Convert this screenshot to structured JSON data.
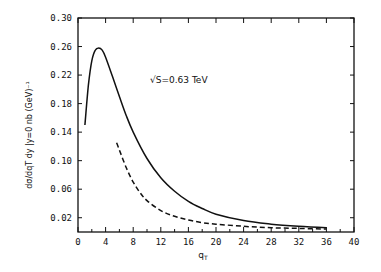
{
  "chart_data": {
    "type": "line",
    "title": "",
    "annotation": "√S=0.63 TeV",
    "xlabel": "qT",
    "ylabel": "dσ/dqT dy |y=0  nb (GeV)⁻¹",
    "xlim": [
      0,
      40
    ],
    "ylim": [
      0,
      0.3
    ],
    "x_ticks": [
      0,
      4,
      8,
      12,
      16,
      20,
      24,
      28,
      32,
      36,
      40
    ],
    "y_ticks": [
      0.02,
      0.06,
      0.1,
      0.14,
      0.18,
      0.22,
      0.26,
      0.3
    ],
    "grid": false,
    "legend": null,
    "series": [
      {
        "name": "solid",
        "style": "solid",
        "x": [
          1.0,
          1.5,
          2.0,
          2.5,
          3.0,
          3.5,
          4.0,
          5.0,
          6.0,
          7.0,
          8.0,
          10.0,
          12.0,
          14.0,
          16.0,
          18.0,
          20.0,
          24.0,
          28.0,
          32.0,
          36.0
        ],
        "y": [
          0.15,
          0.205,
          0.24,
          0.255,
          0.258,
          0.255,
          0.245,
          0.218,
          0.19,
          0.163,
          0.14,
          0.103,
          0.076,
          0.057,
          0.043,
          0.033,
          0.025,
          0.016,
          0.011,
          0.008,
          0.006
        ]
      },
      {
        "name": "dashed",
        "style": "dashed",
        "x": [
          5.6,
          6.0,
          7.0,
          8.0,
          9.0,
          10.0,
          12.0,
          14.0,
          16.0,
          18.0,
          20.0,
          24.0,
          28.0,
          32.0,
          36.0
        ],
        "y": [
          0.125,
          0.115,
          0.09,
          0.07,
          0.055,
          0.044,
          0.03,
          0.022,
          0.017,
          0.013,
          0.011,
          0.008,
          0.006,
          0.005,
          0.004
        ]
      }
    ]
  }
}
